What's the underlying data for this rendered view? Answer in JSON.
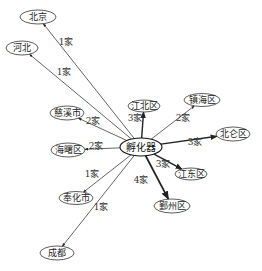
{
  "diagram": {
    "center": {
      "label": "孵化器",
      "x": 141,
      "y": 147,
      "rx": 21,
      "ry": 9
    },
    "nodes": [
      {
        "id": "beijing",
        "label": "北京",
        "x": 38,
        "y": 17,
        "rx": 18,
        "ry": 7
      },
      {
        "id": "hebei",
        "label": "河北",
        "x": 22,
        "y": 48,
        "rx": 16,
        "ry": 7
      },
      {
        "id": "cixi",
        "label": "慈溪市",
        "x": 67,
        "y": 113,
        "rx": 17,
        "ry": 7
      },
      {
        "id": "haishu",
        "label": "海曙区",
        "x": 68,
        "y": 150,
        "rx": 17,
        "ry": 7
      },
      {
        "id": "fenghua",
        "label": "奉化市",
        "x": 76,
        "y": 198,
        "rx": 17,
        "ry": 6.5
      },
      {
        "id": "chengdu",
        "label": "成都",
        "x": 57,
        "y": 253,
        "rx": 17,
        "ry": 7
      },
      {
        "id": "jiangbei",
        "label": "江北区",
        "x": 144,
        "y": 106,
        "rx": 16,
        "ry": 6
      },
      {
        "id": "zhenhai",
        "label": "镇海区",
        "x": 202,
        "y": 100,
        "rx": 18,
        "ry": 6.5
      },
      {
        "id": "beilun",
        "label": "北仑区",
        "x": 233,
        "y": 134,
        "rx": 17,
        "ry": 7
      },
      {
        "id": "jiangdong",
        "label": "江东区",
        "x": 191,
        "y": 174,
        "rx": 16,
        "ry": 6
      },
      {
        "id": "yinzhou",
        "label": "鄞州区",
        "x": 172,
        "y": 206,
        "rx": 18,
        "ry": 7
      }
    ],
    "edges": [
      {
        "to": "beijing",
        "label": "1家",
        "lx": 66,
        "ly": 45,
        "weight": 1
      },
      {
        "to": "hebei",
        "label": "1家",
        "lx": 64,
        "ly": 75,
        "weight": 1
      },
      {
        "to": "cixi",
        "label": "2家",
        "lx": 93,
        "ly": 124,
        "weight": 1
      },
      {
        "to": "haishu",
        "label": "2家",
        "lx": 96,
        "ly": 149,
        "weight": 1
      },
      {
        "to": "fenghua",
        "label": "1家",
        "lx": 92,
        "ly": 177,
        "weight": 1
      },
      {
        "to": "chengdu",
        "label": "1家",
        "lx": 101,
        "ly": 210,
        "weight": 1
      },
      {
        "to": "jiangbei",
        "label": "3家",
        "lx": 135,
        "ly": 121,
        "weight": 2
      },
      {
        "to": "zhenhai",
        "label": "2家",
        "lx": 183,
        "ly": 121,
        "weight": 1
      },
      {
        "to": "beilun",
        "label": "3家",
        "lx": 195,
        "ly": 145,
        "weight": 2
      },
      {
        "to": "jiangdong",
        "label": "3家",
        "lx": 163,
        "ly": 167,
        "weight": 2
      },
      {
        "to": "yinzhou",
        "label": "4家",
        "lx": 141,
        "ly": 183,
        "weight": 2.5
      }
    ]
  }
}
